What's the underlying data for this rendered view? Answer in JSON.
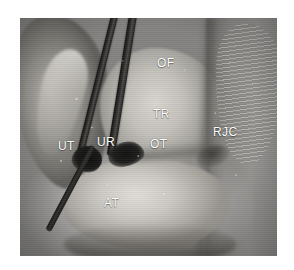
{
  "figure": {
    "kind": "anatomical-specimen-photograph",
    "modality": "grayscale surgical dissection photo",
    "background_color": "#ffffff",
    "plate": {
      "left": 20,
      "top": 18,
      "width": 257,
      "height": 238,
      "border_color": "#b8b6b1"
    }
  },
  "annotations": [
    {
      "id": "of",
      "label": "OF",
      "name": "label-of",
      "x": 137,
      "y": 39,
      "color": "#ffffff"
    },
    {
      "id": "tr",
      "label": "TR",
      "name": "label-tr",
      "x": 133,
      "y": 90,
      "color": "#ffffff"
    },
    {
      "id": "ot",
      "label": "OT",
      "name": "label-ot",
      "x": 130,
      "y": 120,
      "color": "#ffffff"
    },
    {
      "id": "rjc",
      "label": "RJC",
      "name": "label-rjc",
      "x": 193,
      "y": 108,
      "color": "#ffffff"
    },
    {
      "id": "ut",
      "label": "UT",
      "name": "label-ut",
      "x": 38,
      "y": 122,
      "color": "#ffffff"
    },
    {
      "id": "ur",
      "label": "UR",
      "name": "label-ur",
      "x": 77,
      "y": 118,
      "color": "#ffffff"
    },
    {
      "id": "at",
      "label": "AT",
      "name": "label-at",
      "x": 84,
      "y": 179,
      "color": "#ffffff"
    }
  ],
  "instruments": [
    {
      "id": "probe-1",
      "name": "instrument-probe-upper-left",
      "color": "#171716"
    },
    {
      "id": "probe-2",
      "name": "instrument-probe-upper-right",
      "color": "#171716"
    },
    {
      "id": "probe-3",
      "name": "instrument-probe-lower-left",
      "color": "#171716"
    }
  ],
  "palette": {
    "tissue_light": "#dad7d1",
    "tissue_mid": "#a9a7a1",
    "tissue_dark": "#6e6d69",
    "cavity_black": "#101010",
    "label_white": "#ffffff",
    "page_white": "#ffffff"
  }
}
